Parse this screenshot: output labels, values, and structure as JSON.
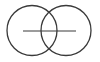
{
  "diagram": {
    "type": "two-overlapping-circles-with-horizontal-line",
    "stroke_color": "#3a3a3a",
    "background": "#ffffff",
    "shapes": {
      "left_circle": {
        "cx": 32,
        "cy": 30.5,
        "r": 25
      },
      "right_circle": {
        "cx": 66,
        "cy": 30.5,
        "r": 25
      },
      "horizontal_line": {
        "x1": 23,
        "y1": 31,
        "x2": 76,
        "y2": 31
      }
    }
  }
}
